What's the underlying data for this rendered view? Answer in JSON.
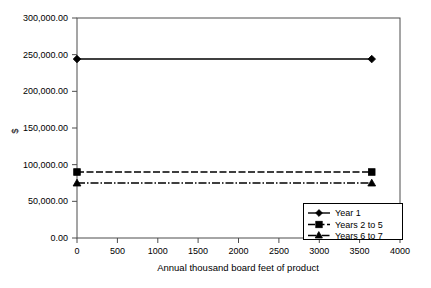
{
  "chart_data": {
    "type": "line",
    "title": "",
    "xlabel": "Annual thousand board feet of product",
    "ylabel": "$",
    "xlim": [
      0,
      4000
    ],
    "ylim": [
      0,
      300000
    ],
    "grid": false,
    "legend_position": "bottom-right-inside",
    "x_ticks": [
      "0",
      "500",
      "1000",
      "1500",
      "2000",
      "2500",
      "3000",
      "3500",
      "4000"
    ],
    "x_tick_values": [
      0,
      500,
      1000,
      1500,
      2000,
      2500,
      3000,
      3500,
      4000
    ],
    "y_ticks": [
      "0.00",
      "50,000.00",
      "100,000.00",
      "150,000.00",
      "200,000.00",
      "250,000.00",
      "300,000.00"
    ],
    "y_tick_values": [
      0,
      50000,
      100000,
      150000,
      200000,
      250000,
      300000
    ],
    "series": [
      {
        "name": "Year 1",
        "line_style": "solid",
        "marker": "diamond",
        "color": "#000000",
        "x": [
          0,
          3650
        ],
        "values": [
          244000,
          244000
        ]
      },
      {
        "name": "Years 2 to 5",
        "line_style": "dashed",
        "marker": "square",
        "color": "#000000",
        "x": [
          0,
          3650
        ],
        "values": [
          90000,
          90000
        ]
      },
      {
        "name": "Years 6 to 7",
        "line_style": "dash-dot",
        "marker": "triangle",
        "color": "#000000",
        "x": [
          0,
          3650
        ],
        "values": [
          75000,
          75000
        ]
      }
    ]
  },
  "axes": {
    "y_title": "$",
    "x_title": "Annual thousand board feet of product",
    "y_labels": {
      "t0": "0.00",
      "t1": "50,000.00",
      "t2": "100,000.00",
      "t3": "150,000.00",
      "t4": "200,000.00",
      "t5": "250,000.00",
      "t6": "300,000.00"
    },
    "x_labels": {
      "t0": "0",
      "t1": "500",
      "t2": "1000",
      "t3": "1500",
      "t4": "2000",
      "t5": "2500",
      "t6": "3000",
      "t7": "3500",
      "t8": "4000"
    }
  },
  "legend": {
    "entries": [
      {
        "label": "Year 1",
        "marker": "diamond-marker-icon",
        "line_style": "solid"
      },
      {
        "label": "Years 2 to 5",
        "marker": "square-marker-icon",
        "line_style": "dashed"
      },
      {
        "label": "Years 6 to 7",
        "marker": "triangle-marker-icon",
        "line_style": "dash-dot"
      }
    ]
  },
  "colors": {
    "background": "#ffffff",
    "axis": "#4d4d4d",
    "series": "#000000",
    "legend_border": "#000000"
  }
}
